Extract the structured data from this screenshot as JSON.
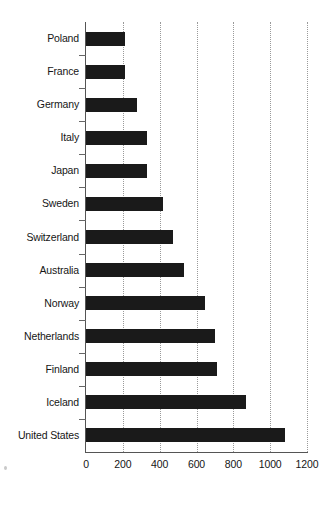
{
  "chart": {
    "type": "bar",
    "orientation": "horizontal",
    "title": "",
    "xlabel": "",
    "ylabel": "",
    "bar_color": "#1a1a1a",
    "grid": "vertical-dotted",
    "legend": "none"
  },
  "chart_data": {
    "type": "bar",
    "title": "",
    "xlabel": "",
    "ylabel": "",
    "xlim": [
      0,
      1200
    ],
    "ylim": null,
    "grid": true,
    "legend": null,
    "orientation": "horizontal",
    "categories": [
      "Poland",
      "France",
      "Germany",
      "Italy",
      "Japan",
      "Sweden",
      "Switzerland",
      "Australia",
      "Norway",
      "Netherlands",
      "Finland",
      "Iceland",
      "United States"
    ],
    "values": [
      210,
      210,
      275,
      330,
      330,
      420,
      470,
      530,
      645,
      700,
      710,
      870,
      1080
    ],
    "xticks": [
      0,
      200,
      400,
      600,
      800,
      1000,
      1200
    ],
    "xtick_labels": [
      "0",
      "200",
      "400",
      "600",
      "800",
      "1000",
      "1200"
    ]
  },
  "axis": {
    "x_ticks": [
      "0",
      "200",
      "400",
      "600",
      "800",
      "1000",
      "1200"
    ],
    "y_categories": [
      "Poland",
      "France",
      "Germany",
      "Italy",
      "Japan",
      "Sweden",
      "Switzerland",
      "Australia",
      "Norway",
      "Netherlands",
      "Finland",
      "Iceland",
      "United States"
    ]
  }
}
